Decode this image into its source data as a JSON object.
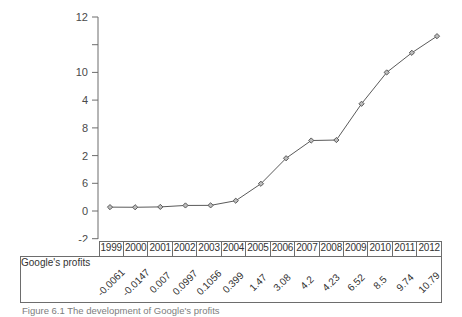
{
  "chart_data": {
    "type": "line",
    "title": "",
    "xlabel": "",
    "ylabel": "",
    "ylim": [
      -2,
      12
    ],
    "yticks": [
      -2,
      0,
      2,
      4,
      6,
      8,
      10,
      12
    ],
    "ytick_labels": [
      "-2",
      "0",
      "2",
      "4",
      "6",
      "8",
      "10",
      "12"
    ],
    "grid": false,
    "legend": "none",
    "marker": "diamond",
    "line_color": "#5a5a5a",
    "marker_fill": "#bdbdbd",
    "categories": [
      "1999",
      "2000",
      "2001",
      "2002",
      "2003",
      "2004",
      "2005",
      "2006",
      "2007",
      "2008",
      "2009",
      "2010",
      "2011",
      "2012"
    ],
    "series": [
      {
        "name": "Google's profits",
        "values": [
          -0.0061,
          -0.0147,
          0.007,
          0.0997,
          0.1056,
          0.399,
          1.47,
          3.08,
          4.2,
          4.23,
          6.52,
          8.5,
          9.74,
          10.79
        ]
      }
    ]
  },
  "table": {
    "row_label": "Google's profits",
    "years": [
      "1999",
      "2000",
      "2001",
      "2002",
      "2003",
      "2004",
      "2005",
      "2006",
      "2007",
      "2008",
      "2009",
      "2010",
      "2011",
      "2012"
    ],
    "values": [
      "-0.0061",
      "-0.0147",
      "0.007",
      "0.0997",
      "0.1056",
      "0.399",
      "1.47",
      "3.08",
      "4.2",
      "4.23",
      "6.52",
      "8.5",
      "9.74",
      "10.79"
    ]
  },
  "caption": {
    "text": "Figure 6.1   The development of Google's profits"
  }
}
